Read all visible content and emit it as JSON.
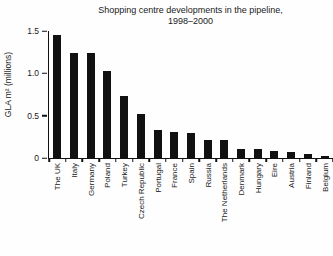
{
  "chart": {
    "title_line1": "Shopping centre developments in the pipeline,",
    "title_line2": "1998–2000",
    "ylabel": "GLA m² (millions)"
  },
  "chart_data": {
    "type": "bar",
    "title": "Shopping centre developments in the pipeline, 1998–2000",
    "xlabel": "",
    "ylabel": "GLA m² (millions)",
    "categories": [
      "The UK",
      "Italy",
      "Germany",
      "Poland",
      "Turkey",
      "Czech Republic",
      "Portugal",
      "France",
      "Spain",
      "Russia",
      "The Netherlands",
      "Denmark",
      "Hungary",
      "Eire",
      "Austria",
      "Finland",
      "Belgium"
    ],
    "values": [
      1.45,
      1.24,
      1.24,
      1.03,
      0.73,
      0.52,
      0.33,
      0.31,
      0.3,
      0.21,
      0.21,
      0.11,
      0.11,
      0.08,
      0.07,
      0.05,
      0.02
    ],
    "ylim": [
      0,
      1.5
    ],
    "yticks": [
      0,
      0.5,
      1.0,
      1.5
    ],
    "ytick_labels": [
      "0",
      "0.5",
      "1.0",
      "1.5"
    ],
    "grid": false,
    "legend": false,
    "bar_color": "#111111",
    "background_color": "#fefefe"
  }
}
